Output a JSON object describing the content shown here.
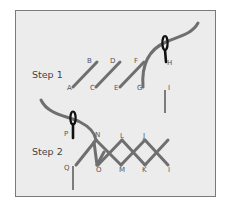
{
  "diagram": {
    "colors": {
      "panel_bg": "#ececec",
      "panel_border": "#7a7a7a",
      "thread": "#6f6f6f",
      "needle": "#111111",
      "text": "#555555"
    },
    "step1": {
      "label": "Step 1",
      "points": [
        {
          "id": "A",
          "label": "A"
        },
        {
          "id": "B",
          "label": "B"
        },
        {
          "id": "C",
          "label": "C"
        },
        {
          "id": "D",
          "label": "D"
        },
        {
          "id": "E",
          "label": "E"
        },
        {
          "id": "F",
          "label": "F"
        },
        {
          "id": "G",
          "label": "G"
        },
        {
          "id": "H",
          "label": "H"
        },
        {
          "id": "I",
          "label": "I"
        }
      ]
    },
    "step2": {
      "label": "Step 2",
      "points": [
        {
          "id": "P",
          "label": "P"
        },
        {
          "id": "N",
          "label": "N"
        },
        {
          "id": "L",
          "label": "L"
        },
        {
          "id": "J",
          "label": "J"
        },
        {
          "id": "Q",
          "label": "Q"
        },
        {
          "id": "O",
          "label": "O"
        },
        {
          "id": "M",
          "label": "M"
        },
        {
          "id": "K",
          "label": "K"
        },
        {
          "id": "I",
          "label": "I"
        }
      ]
    }
  }
}
